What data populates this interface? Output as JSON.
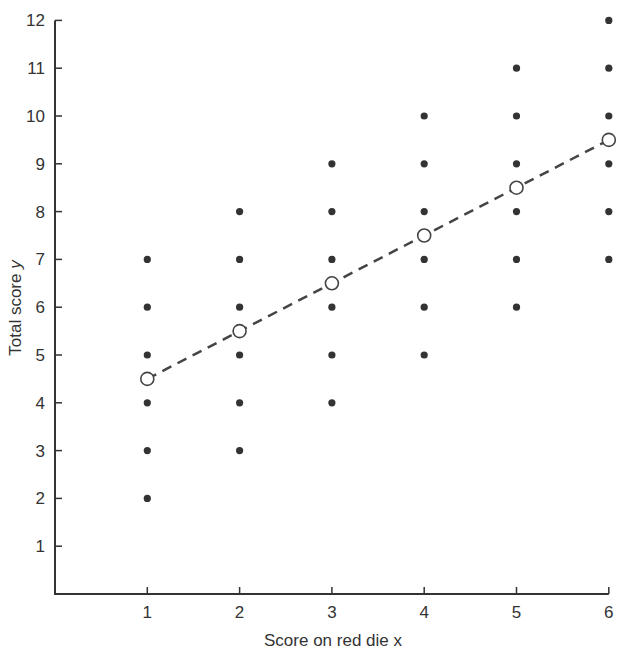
{
  "chart_data": {
    "type": "scatter",
    "title": "",
    "xlabel": "Score on red die x",
    "ylabel": "Total score y",
    "ylabel_plain": "Total score ",
    "ylabel_italic": "y",
    "x_ticks": [
      1,
      2,
      3,
      4,
      5,
      6
    ],
    "y_ticks": [
      1,
      2,
      3,
      4,
      5,
      6,
      7,
      8,
      9,
      10,
      11,
      12
    ],
    "xlim": [
      0,
      6
    ],
    "ylim": [
      0,
      12
    ],
    "grid": false,
    "legend": null,
    "series": [
      {
        "name": "Outcomes",
        "marker": "filled-circle",
        "points": [
          [
            1,
            2
          ],
          [
            1,
            3
          ],
          [
            1,
            4
          ],
          [
            1,
            5
          ],
          [
            1,
            6
          ],
          [
            1,
            7
          ],
          [
            2,
            3
          ],
          [
            2,
            4
          ],
          [
            2,
            5
          ],
          [
            2,
            6
          ],
          [
            2,
            7
          ],
          [
            2,
            8
          ],
          [
            3,
            4
          ],
          [
            3,
            5
          ],
          [
            3,
            6
          ],
          [
            3,
            7
          ],
          [
            3,
            8
          ],
          [
            3,
            9
          ],
          [
            4,
            5
          ],
          [
            4,
            6
          ],
          [
            4,
            7
          ],
          [
            4,
            8
          ],
          [
            4,
            9
          ],
          [
            4,
            10
          ],
          [
            5,
            6
          ],
          [
            5,
            7
          ],
          [
            5,
            8
          ],
          [
            5,
            9
          ],
          [
            5,
            10
          ],
          [
            5,
            11
          ],
          [
            6,
            7
          ],
          [
            6,
            8
          ],
          [
            6,
            9
          ],
          [
            6,
            10
          ],
          [
            6,
            11
          ],
          [
            6,
            12
          ]
        ]
      },
      {
        "name": "Conditional means",
        "marker": "open-circle",
        "line": "dashed",
        "points": [
          [
            1,
            4.5
          ],
          [
            2,
            5.5
          ],
          [
            3,
            6.5
          ],
          [
            4,
            7.5
          ],
          [
            5,
            8.5
          ],
          [
            6,
            9.5
          ]
        ]
      }
    ]
  },
  "colors": {
    "axis": "#333333",
    "dot": "#333333",
    "line": "#444444",
    "background": "#ffffff"
  }
}
